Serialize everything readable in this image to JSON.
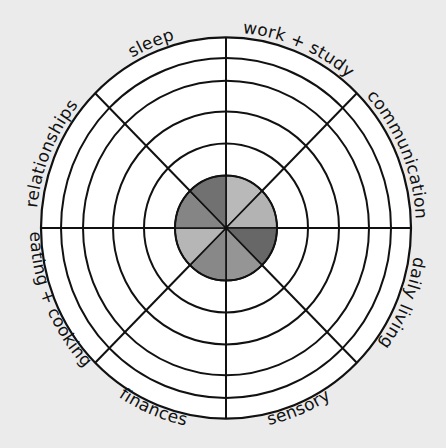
{
  "diagram": {
    "type": "wheel-of-life",
    "ring_count": 5,
    "segments": [
      {
        "label": "work + study",
        "center_fill": "#b9b9b9"
      },
      {
        "label": "communication",
        "center_fill": "#b3b3b3"
      },
      {
        "label": "daily living",
        "center_fill": "#676767"
      },
      {
        "label": "sensory",
        "center_fill": "#959595"
      },
      {
        "label": "finances",
        "center_fill": "#888888"
      },
      {
        "label": "eating + cooking",
        "center_fill": "#b6b6b6"
      },
      {
        "label": "relationships",
        "center_fill": "#858585"
      },
      {
        "label": "sleep",
        "center_fill": "#717171"
      }
    ]
  },
  "colors": {
    "background": "#ebebeb",
    "wheel_fill": "#ffffff",
    "line": "#111111"
  }
}
